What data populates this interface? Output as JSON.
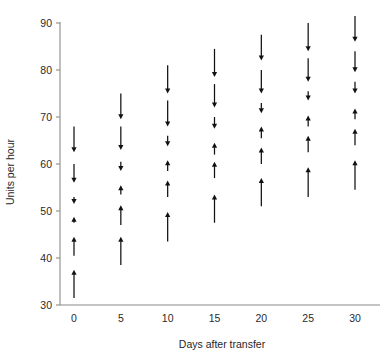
{
  "chart_data": {
    "type": "scatter",
    "title": "",
    "subtitle": "",
    "xlabel": "Days after transfer",
    "ylabel": "Units per hour",
    "xlim": [
      -2.6,
      33
    ],
    "ylim": [
      30,
      92
    ],
    "xticks": [
      0,
      5,
      10,
      15,
      20,
      25,
      30
    ],
    "xtick_labels": [
      "0",
      "5",
      "10",
      "15",
      "20",
      "25",
      "30"
    ],
    "yticks": [
      30,
      40,
      50,
      60,
      70,
      80,
      90
    ],
    "ytick_labels": [
      "30",
      "40",
      "50",
      "60",
      "70",
      "80",
      "90"
    ],
    "grid": false,
    "legend": null,
    "marker": "arrow",
    "series": [
      {
        "name": "Day 0",
        "x": 0,
        "arrows": [
          {
            "from": 68.0,
            "to": 62.5,
            "direction": "down"
          },
          {
            "from": 60.0,
            "to": 56.0,
            "direction": "down"
          },
          {
            "from": 53.0,
            "to": 51.5,
            "direction": "down"
          },
          {
            "from": 47.5,
            "to": 48.8,
            "direction": "up"
          },
          {
            "from": 40.5,
            "to": 44.5,
            "direction": "up"
          },
          {
            "from": 31.5,
            "to": 37.5,
            "direction": "up"
          }
        ]
      },
      {
        "name": "Day 5",
        "x": 5,
        "arrows": [
          {
            "from": 75.0,
            "to": 69.5,
            "direction": "down"
          },
          {
            "from": 68.0,
            "to": 63.0,
            "direction": "down"
          },
          {
            "from": 60.5,
            "to": 58.5,
            "direction": "down"
          },
          {
            "from": 53.5,
            "to": 55.5,
            "direction": "up"
          },
          {
            "from": 47.0,
            "to": 51.2,
            "direction": "up"
          },
          {
            "from": 38.5,
            "to": 44.5,
            "direction": "up"
          }
        ]
      },
      {
        "name": "Day 10",
        "x": 10,
        "arrows": [
          {
            "from": 81.0,
            "to": 75.0,
            "direction": "down"
          },
          {
            "from": 73.5,
            "to": 68.0,
            "direction": "down"
          },
          {
            "from": 66.0,
            "to": 63.8,
            "direction": "down"
          },
          {
            "from": 58.5,
            "to": 60.8,
            "direction": "up"
          },
          {
            "from": 53.0,
            "to": 56.5,
            "direction": "up"
          },
          {
            "from": 43.5,
            "to": 49.8,
            "direction": "up"
          }
        ]
      },
      {
        "name": "Day 15",
        "x": 15,
        "arrows": [
          {
            "from": 84.5,
            "to": 78.5,
            "direction": "down"
          },
          {
            "from": 77.0,
            "to": 72.0,
            "direction": "down"
          },
          {
            "from": 70.0,
            "to": 67.5,
            "direction": "down"
          },
          {
            "from": 62.0,
            "to": 64.5,
            "direction": "up"
          },
          {
            "from": 57.0,
            "to": 60.5,
            "direction": "up"
          },
          {
            "from": 47.5,
            "to": 53.5,
            "direction": "up"
          }
        ]
      },
      {
        "name": "Day 20",
        "x": 20,
        "arrows": [
          {
            "from": 87.5,
            "to": 82.0,
            "direction": "down"
          },
          {
            "from": 80.0,
            "to": 75.0,
            "direction": "down"
          },
          {
            "from": 73.0,
            "to": 70.8,
            "direction": "down"
          },
          {
            "from": 65.5,
            "to": 68.0,
            "direction": "up"
          },
          {
            "from": 60.0,
            "to": 63.5,
            "direction": "up"
          },
          {
            "from": 51.0,
            "to": 57.0,
            "direction": "up"
          }
        ]
      },
      {
        "name": "Day 25",
        "x": 25,
        "arrows": [
          {
            "from": 90.0,
            "to": 84.0,
            "direction": "down"
          },
          {
            "from": 82.5,
            "to": 77.5,
            "direction": "down"
          },
          {
            "from": 75.5,
            "to": 73.5,
            "direction": "down"
          },
          {
            "from": 68.0,
            "to": 70.3,
            "direction": "up"
          },
          {
            "from": 62.5,
            "to": 66.0,
            "direction": "up"
          },
          {
            "from": 53.0,
            "to": 59.3,
            "direction": "up"
          }
        ]
      },
      {
        "name": "Day 30",
        "x": 30,
        "arrows": [
          {
            "from": 91.5,
            "to": 86.0,
            "direction": "down"
          },
          {
            "from": 84.0,
            "to": 79.5,
            "direction": "down"
          },
          {
            "from": 77.5,
            "to": 75.0,
            "direction": "down"
          },
          {
            "from": 69.5,
            "to": 71.8,
            "direction": "up"
          },
          {
            "from": 64.0,
            "to": 67.5,
            "direction": "up"
          },
          {
            "from": 54.5,
            "to": 60.8,
            "direction": "up"
          }
        ]
      }
    ]
  },
  "colors": {
    "axis": "#8a8a8a",
    "arrow": "#111111",
    "text": "#1f1f1f",
    "background": "#ffffff"
  }
}
